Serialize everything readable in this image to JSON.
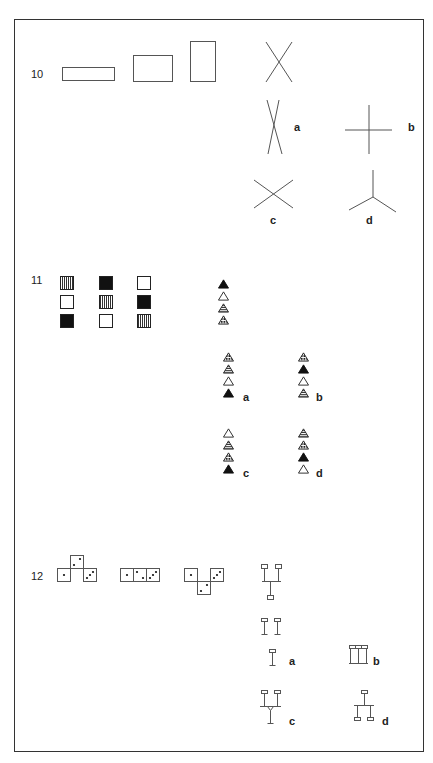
{
  "problems": [
    {
      "number": "10",
      "stimulus": "rectangles-and-cross",
      "options": [
        {
          "label": "a",
          "shape": "narrow-x"
        },
        {
          "label": "b",
          "shape": "plus-cross"
        },
        {
          "label": "c",
          "shape": "wide-x"
        },
        {
          "label": "d",
          "shape": "y-junction"
        }
      ]
    },
    {
      "number": "11",
      "stimulus": "3x3-square-pattern-grid",
      "grid": [
        [
          "striped",
          "black",
          "white"
        ],
        [
          "white",
          "striped",
          "black"
        ],
        [
          "black",
          "white",
          "striped"
        ]
      ],
      "triangle_stack": [
        "black",
        "white",
        "striped",
        "dotted"
      ],
      "options": [
        {
          "label": "a",
          "stack": [
            "dotted",
            "striped",
            "white",
            "black"
          ]
        },
        {
          "label": "b",
          "stack": [
            "dotted",
            "black",
            "white",
            "striped"
          ]
        },
        {
          "label": "c",
          "stack": [
            "white",
            "striped",
            "dotted",
            "black"
          ]
        },
        {
          "label": "d",
          "stack": [
            "striped",
            "dotted",
            "black",
            "white"
          ]
        }
      ]
    },
    {
      "number": "12",
      "stimulus": "dice-arrangements",
      "options": [
        {
          "label": "a",
          "shape": "two-pins-and-single-pin"
        },
        {
          "label": "b",
          "shape": "three-pin-bar"
        },
        {
          "label": "c",
          "shape": "merged-fork"
        },
        {
          "label": "d",
          "shape": "inverted-tree"
        }
      ]
    }
  ],
  "colors": {
    "line": "#555555",
    "fill_dark": "#111111",
    "border": "#333333"
  }
}
